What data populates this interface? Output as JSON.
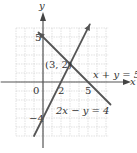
{
  "chart_data": {
    "type": "line",
    "title": "",
    "xlabel": "x",
    "ylabel": "y",
    "xlim": [
      -3,
      7
    ],
    "ylim": [
      -6,
      6
    ],
    "grid": true,
    "x_tick_labels": [
      {
        "value": 0,
        "text": "0"
      },
      {
        "value": 2,
        "text": "2"
      },
      {
        "value": 5,
        "text": "5"
      }
    ],
    "y_tick_labels": [
      {
        "value": 5,
        "text": "5"
      },
      {
        "value": -4,
        "text": "−4"
      }
    ],
    "series": [
      {
        "name": "x + y = 5",
        "label": "x + y = 5",
        "x": [
          -0.5,
          7.5
        ],
        "y": [
          5.5,
          -2.5
        ],
        "color": "#555555"
      },
      {
        "name": "2x − y = 4",
        "label": "2x − y = 4",
        "x": [
          -1,
          5.2
        ],
        "y": [
          -6,
          6.4
        ],
        "color": "#555555"
      }
    ],
    "annotations": [
      {
        "text": "(3, 2)",
        "x": 3,
        "y": 2,
        "type": "intersection-point"
      }
    ]
  }
}
